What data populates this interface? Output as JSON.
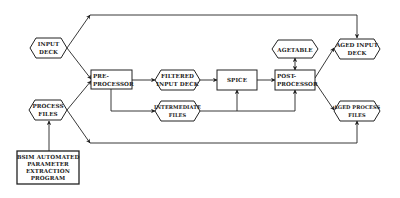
{
  "diagram": {
    "nodes": [
      {
        "id": "input_deck",
        "shape": "hexagon",
        "lines": [
          "INPUT",
          "DECK"
        ]
      },
      {
        "id": "process_files",
        "shape": "hexagon",
        "lines": [
          "PROCESS",
          "FILES"
        ]
      },
      {
        "id": "bsim",
        "shape": "rect",
        "lines": [
          "BSIM AUTOMATED",
          "PARAMETER",
          "EXTRACTION",
          "PROGRAM"
        ]
      },
      {
        "id": "pre_processor",
        "shape": "rect",
        "lines": [
          "PRE-",
          "PROCESSOR"
        ]
      },
      {
        "id": "filtered_input_deck",
        "shape": "hexagon",
        "lines": [
          "FILTERED",
          "INPUT DECK"
        ]
      },
      {
        "id": "intermediate_files",
        "shape": "hexagon",
        "lines": [
          "INTERMEDIATE",
          "FILES"
        ]
      },
      {
        "id": "spice",
        "shape": "rect",
        "lines": [
          "SPICE"
        ]
      },
      {
        "id": "agetable",
        "shape": "hexagon",
        "lines": [
          "AGETABLE"
        ]
      },
      {
        "id": "post_processor",
        "shape": "rect",
        "lines": [
          "POST-",
          "PROCESSOR"
        ]
      },
      {
        "id": "aged_input_deck",
        "shape": "hexagon",
        "lines": [
          "AGED INPUT",
          "DECK"
        ]
      },
      {
        "id": "aged_process_files",
        "shape": "hexagon",
        "lines": [
          "AGED PROCESS",
          "FILES"
        ]
      }
    ],
    "edges": [
      {
        "from": "input_deck",
        "to": "aged_input_deck"
      },
      {
        "from": "input_deck",
        "to": "pre_processor"
      },
      {
        "from": "process_files",
        "to": "pre_processor"
      },
      {
        "from": "process_files",
        "to": "aged_process_files"
      },
      {
        "from": "bsim",
        "to": "process_files"
      },
      {
        "from": "pre_processor",
        "to": "filtered_input_deck"
      },
      {
        "from": "pre_processor",
        "to": "intermediate_files"
      },
      {
        "from": "filtered_input_deck",
        "to": "spice"
      },
      {
        "from": "intermediate_files",
        "to": "spice"
      },
      {
        "from": "intermediate_files",
        "to": "post_processor"
      },
      {
        "from": "spice",
        "to": "post_processor"
      },
      {
        "from": "agetable",
        "to": "post_processor",
        "bidirectional": true
      },
      {
        "from": "post_processor",
        "to": "aged_input_deck"
      },
      {
        "from": "post_processor",
        "to": "aged_process_files"
      }
    ]
  },
  "labels": {
    "input_deck": [
      "INPUT",
      "DECK"
    ],
    "process_files": [
      "PROCESS",
      "FILES"
    ],
    "bsim": [
      "BSIM AUTOMATED",
      "PARAMETER",
      "EXTRACTION",
      "PROGRAM"
    ],
    "pre_processor": [
      "PRE-",
      "PROCESSOR"
    ],
    "filtered_input_deck": [
      "FILTERED",
      "INPUT DECK"
    ],
    "intermediate_files": [
      "INTERMEDIATE",
      "FILES"
    ],
    "spice": [
      "SPICE"
    ],
    "agetable": [
      "AGETABLE"
    ],
    "post_processor": [
      "POST-",
      "PROCESSOR"
    ],
    "aged_input_deck": [
      "AGED INPUT",
      "DECK"
    ],
    "aged_process_files": [
      "AGED PROCESS",
      "FILES"
    ]
  }
}
